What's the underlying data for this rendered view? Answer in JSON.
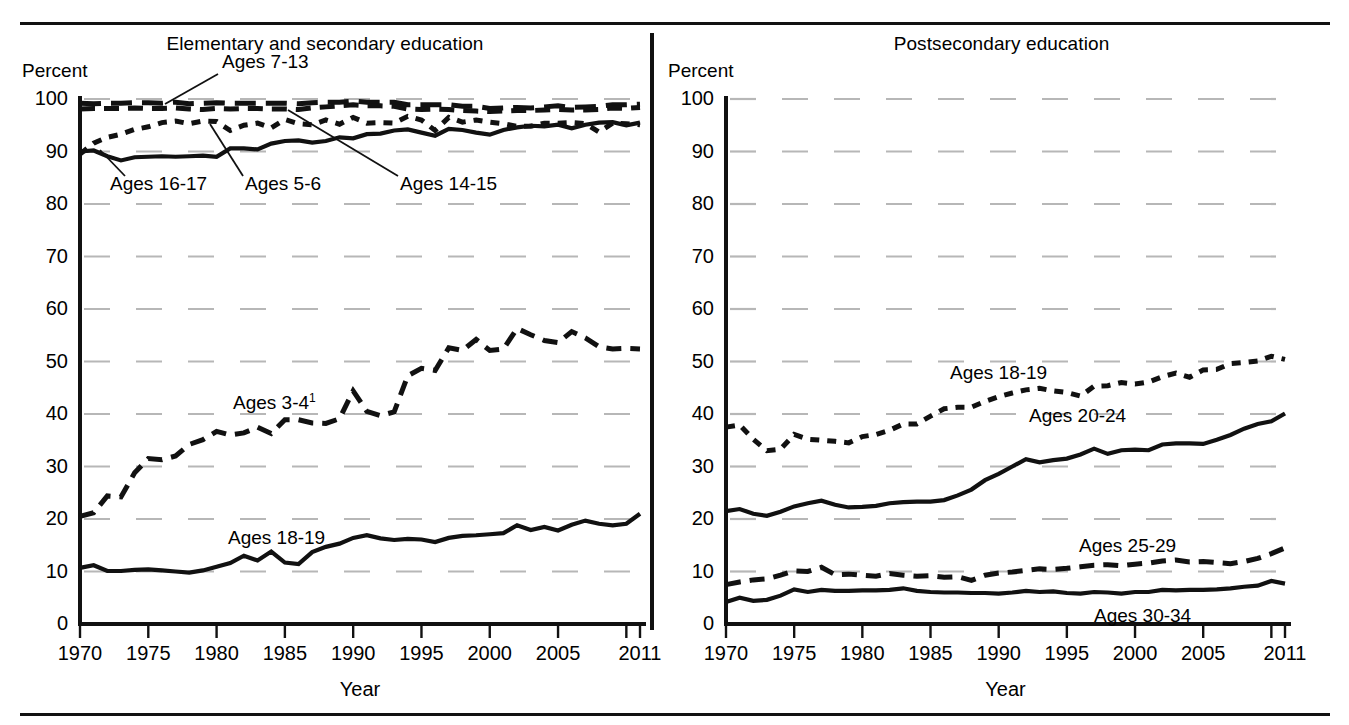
{
  "figure": {
    "background": "#ffffff",
    "ink_color": "#111111",
    "grid_color": "#b7b7b7"
  },
  "panels": [
    {
      "id": "elementary-secondary",
      "title": "Elementary and secondary education",
      "y_axis_unit": "Percent",
      "x_axis_label": "Year"
    },
    {
      "id": "postsecondary",
      "title": "Postsecondary education",
      "y_axis_unit": "Percent",
      "x_axis_label": "Year"
    }
  ],
  "chart_data": [
    {
      "type": "line",
      "title": "Elementary and secondary education",
      "xlabel": "Year",
      "ylabel": "Percent",
      "xlim": [
        1970,
        2011
      ],
      "ylim": [
        0,
        100
      ],
      "yticks": [
        0,
        10,
        20,
        30,
        40,
        50,
        60,
        70,
        80,
        90,
        100
      ],
      "xticks": [
        1970,
        1975,
        1980,
        1985,
        1990,
        1995,
        2000,
        2005,
        2010,
        2011
      ],
      "xtick_labels": [
        "1970",
        "1975",
        "1980",
        "1985",
        "1990",
        "1995",
        "2000",
        "2005",
        "",
        "2011"
      ],
      "grid": true,
      "legend": "inline-labels",
      "x": [
        1970,
        1971,
        1972,
        1973,
        1974,
        1975,
        1976,
        1977,
        1978,
        1979,
        1980,
        1981,
        1982,
        1983,
        1984,
        1985,
        1986,
        1987,
        1988,
        1989,
        1990,
        1991,
        1992,
        1993,
        1994,
        1995,
        1996,
        1997,
        1998,
        1999,
        2000,
        2001,
        2002,
        2003,
        2004,
        2005,
        2006,
        2007,
        2008,
        2009,
        2010,
        2011
      ],
      "series": [
        {
          "name": "Ages 7-13",
          "style": "long-dash",
          "label": "Ages 7-13",
          "values": [
            99.2,
            99.1,
            99.2,
            99.2,
            99.3,
            99.3,
            99.2,
            99.4,
            99.1,
            99.2,
            99.3,
            99.2,
            99.2,
            99.2,
            99.2,
            99.2,
            99.1,
            99.3,
            99.4,
            99.4,
            99.6,
            99.4,
            99.4,
            99.4,
            98.9,
            98.9,
            98.9,
            98.9,
            98.6,
            98.6,
            98.2,
            98.3,
            98.4,
            98.3,
            98.5,
            98.7,
            98.4,
            98.5,
            98.6,
            98.9,
            98.9,
            99.0
          ]
        },
        {
          "name": "Ages 14-15",
          "style": "dash",
          "label": "Ages 14-15",
          "values": [
            98.1,
            98.2,
            98.2,
            98.2,
            98.3,
            98.2,
            98.2,
            98.3,
            98.1,
            98.0,
            98.2,
            98.1,
            98.2,
            98.2,
            98.1,
            98.1,
            98.0,
            98.3,
            98.5,
            98.7,
            98.9,
            98.7,
            98.7,
            98.6,
            98.1,
            98.0,
            98.1,
            98.0,
            97.8,
            97.7,
            97.6,
            97.7,
            97.8,
            97.8,
            97.9,
            98.0,
            97.9,
            97.9,
            98.0,
            98.3,
            98.2,
            98.4
          ]
        },
        {
          "name": "Ages 5-6",
          "style": "dot",
          "label": "Ages 5-6",
          "values": [
            89.5,
            91.6,
            92.7,
            93.3,
            94.2,
            94.7,
            95.5,
            95.8,
            95.3,
            95.8,
            95.7,
            94.0,
            95.0,
            95.4,
            94.5,
            96.1,
            95.3,
            95.1,
            96.0,
            95.2,
            96.5,
            95.4,
            95.5,
            95.4,
            96.7,
            96.0,
            94.0,
            96.5,
            95.6,
            96.0,
            95.6,
            95.3,
            94.8,
            94.8,
            95.4,
            95.4,
            95.5,
            95.3,
            93.7,
            95.4,
            95.3,
            95.1
          ]
        },
        {
          "name": "Ages 16-17",
          "style": "solid",
          "label": "Ages 16-17",
          "values": [
            90.0,
            90.2,
            89.1,
            88.3,
            88.9,
            89.0,
            89.1,
            89.0,
            89.1,
            89.2,
            89.0,
            90.6,
            90.6,
            90.4,
            91.5,
            92.0,
            92.1,
            91.7,
            92.0,
            92.7,
            92.5,
            93.3,
            93.4,
            94.0,
            94.2,
            93.6,
            93.0,
            94.3,
            94.1,
            93.6,
            93.2,
            94.1,
            94.6,
            94.9,
            94.8,
            95.1,
            94.4,
            95.1,
            95.5,
            95.6,
            95.0,
            95.5
          ]
        },
        {
          "name": "Ages 3-4",
          "style": "dash",
          "label": "Ages 3-4",
          "label_superscript": "1",
          "values": [
            20.5,
            21.2,
            24.4,
            24.2,
            28.8,
            31.5,
            31.3,
            32.0,
            34.2,
            35.1,
            36.7,
            36.0,
            36.4,
            37.5,
            36.3,
            38.9,
            38.9,
            38.3,
            38.2,
            39.1,
            44.4,
            40.5,
            39.7,
            40.4,
            47.3,
            48.7,
            48.3,
            52.6,
            52.1,
            54.2,
            52.1,
            52.4,
            56.3,
            55.1,
            54.0,
            53.6,
            55.7,
            54.5,
            52.8,
            52.4,
            52.5,
            52.4
          ]
        },
        {
          "name": "Ages 18-19",
          "style": "solid",
          "label": "Ages 18-19",
          "values": [
            10.7,
            11.2,
            10.1,
            10.1,
            10.3,
            10.4,
            10.2,
            10.0,
            9.8,
            10.2,
            10.9,
            11.6,
            13.0,
            12.1,
            13.8,
            11.7,
            11.4,
            13.7,
            14.7,
            15.3,
            16.4,
            16.9,
            16.3,
            16.0,
            16.2,
            16.1,
            15.6,
            16.4,
            16.8,
            16.9,
            17.1,
            17.3,
            18.8,
            17.9,
            18.5,
            17.8,
            18.9,
            19.7,
            19.1,
            18.8,
            19.1,
            21.0
          ]
        }
      ]
    },
    {
      "type": "line",
      "title": "Postsecondary education",
      "xlabel": "Year",
      "ylabel": "Percent",
      "xlim": [
        1970,
        2011
      ],
      "ylim": [
        0,
        100
      ],
      "yticks": [
        0,
        10,
        20,
        30,
        40,
        50,
        60,
        70,
        80,
        90,
        100
      ],
      "xticks": [
        1970,
        1975,
        1980,
        1985,
        1990,
        1995,
        2000,
        2005,
        2010,
        2011
      ],
      "xtick_labels": [
        "1970",
        "1975",
        "1980",
        "1985",
        "1990",
        "1995",
        "2000",
        "2005",
        "",
        "2011"
      ],
      "grid": true,
      "legend": "inline-labels",
      "x": [
        1970,
        1971,
        1972,
        1973,
        1974,
        1975,
        1976,
        1977,
        1978,
        1979,
        1980,
        1981,
        1982,
        1983,
        1984,
        1985,
        1986,
        1987,
        1988,
        1989,
        1990,
        1991,
        1992,
        1993,
        1994,
        1995,
        1996,
        1997,
        1998,
        1999,
        2000,
        2001,
        2002,
        2003,
        2004,
        2005,
        2006,
        2007,
        2008,
        2009,
        2010,
        2011
      ],
      "series": [
        {
          "name": "Ages 18-19",
          "style": "dot",
          "label": "Ages 18-19",
          "values": [
            37.5,
            37.9,
            35.2,
            33.0,
            33.3,
            36.1,
            35.2,
            35.0,
            34.8,
            34.5,
            35.7,
            36.1,
            36.9,
            38.1,
            38.1,
            39.6,
            41.0,
            41.3,
            41.3,
            42.4,
            43.3,
            44.0,
            44.6,
            44.9,
            44.4,
            44.1,
            43.4,
            45.3,
            45.4,
            46.0,
            45.7,
            46.1,
            47.1,
            47.8,
            47.0,
            48.4,
            48.5,
            49.6,
            49.8,
            50.1,
            51.0,
            50.4
          ]
        },
        {
          "name": "Ages 20-24",
          "style": "solid",
          "label": "Ages 20-24",
          "values": [
            21.5,
            21.9,
            21.0,
            20.6,
            21.4,
            22.4,
            23.0,
            23.5,
            22.7,
            22.2,
            22.3,
            22.5,
            23.0,
            23.2,
            23.3,
            23.3,
            23.6,
            24.5,
            25.6,
            27.4,
            28.6,
            30.0,
            31.4,
            30.8,
            31.2,
            31.5,
            32.3,
            33.4,
            32.4,
            33.1,
            33.2,
            33.1,
            34.2,
            34.4,
            34.4,
            34.3,
            35.1,
            36.0,
            37.2,
            38.1,
            38.6,
            40.1
          ]
        },
        {
          "name": "Ages 25-29",
          "style": "dash",
          "label": "Ages 25-29",
          "values": [
            7.5,
            8.0,
            8.4,
            8.6,
            9.3,
            10.1,
            10.0,
            10.8,
            9.4,
            9.5,
            9.3,
            9.1,
            9.6,
            9.3,
            9.1,
            9.2,
            8.9,
            9.0,
            8.3,
            9.3,
            9.7,
            9.9,
            10.2,
            10.5,
            10.4,
            10.6,
            10.9,
            11.2,
            11.3,
            11.1,
            11.4,
            11.6,
            12.0,
            12.2,
            11.8,
            11.9,
            11.7,
            11.5,
            11.9,
            12.5,
            13.4,
            14.5
          ]
        },
        {
          "name": "Ages 30-34",
          "style": "solid",
          "label": "Ages 30-34",
          "values": [
            4.2,
            5.0,
            4.4,
            4.6,
            5.4,
            6.6,
            6.1,
            6.5,
            6.3,
            6.3,
            6.4,
            6.4,
            6.5,
            6.8,
            6.3,
            6.1,
            6.0,
            6.0,
            5.9,
            5.9,
            5.8,
            6.0,
            6.3,
            6.1,
            6.2,
            5.9,
            5.8,
            6.1,
            6.0,
            5.8,
            6.1,
            6.1,
            6.5,
            6.4,
            6.5,
            6.5,
            6.6,
            6.8,
            7.1,
            7.3,
            8.2,
            7.7
          ]
        }
      ]
    }
  ]
}
